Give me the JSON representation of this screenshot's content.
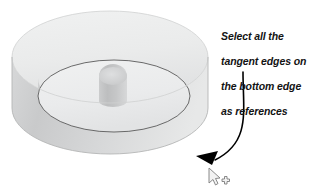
{
  "canvas": {
    "width": 333,
    "height": 196,
    "background": "#ffffff"
  },
  "annotation": {
    "callout_lines": [
      "Select all the",
      "tangent edges on",
      "the bottom edge",
      "as references"
    ],
    "full_text": "Select all the tangent edges on the bottom edge as references",
    "text_color": "#131313",
    "arrow_color": "#000000",
    "arrow_name": "curved-callout-arrow"
  },
  "cursor": {
    "type": "move-select-cursor",
    "fill": "#f2f2f2",
    "stroke": "#7d7d7d"
  },
  "model": {
    "name": "cylindrical-pocket-part",
    "description": "Shaded 3D disc with circular pocket and central boss",
    "colors": {
      "top_face": "#eceded",
      "top_face_shadow": "#e2e3e3",
      "outer_wall_light": "#e6e7e7",
      "outer_wall_dark": "#c9cacb",
      "pocket_floor": "#eeeff0",
      "pocket_wall": "#d5d6d7",
      "boss_light": "#d8d9da",
      "boss_dark": "#bfc0c1",
      "edge_line": "#5a5a5a",
      "silhouette_line": "#b4b5b6"
    }
  }
}
